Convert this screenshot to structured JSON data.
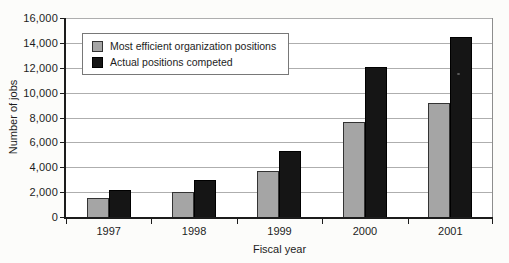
{
  "chart_data": {
    "type": "bar",
    "title": "",
    "xlabel": "Fiscal year",
    "ylabel": "Number of jobs",
    "categories": [
      "1997",
      "1998",
      "1999",
      "2000",
      "2001"
    ],
    "series": [
      {
        "name": "Most efficient organization positions",
        "color": "#a5a5a5",
        "values": [
          1500,
          2000,
          3700,
          7600,
          9200
        ]
      },
      {
        "name": "Actual positions competed",
        "color": "#151515",
        "values": [
          2200,
          3000,
          5300,
          12100,
          14500
        ]
      }
    ],
    "ylim": [
      0,
      16000
    ],
    "ytick_step": 2000,
    "ytick_labels": [
      "0",
      "2,000",
      "4,000",
      "6,000",
      "8,000",
      "10,000",
      "12,000",
      "14,000",
      "16,000"
    ],
    "grid": true,
    "legend_position": "top-left",
    "plot_background": "#ffffff",
    "gridline_color": "#aeaeae",
    "axis_color": "#1c1c1c"
  }
}
